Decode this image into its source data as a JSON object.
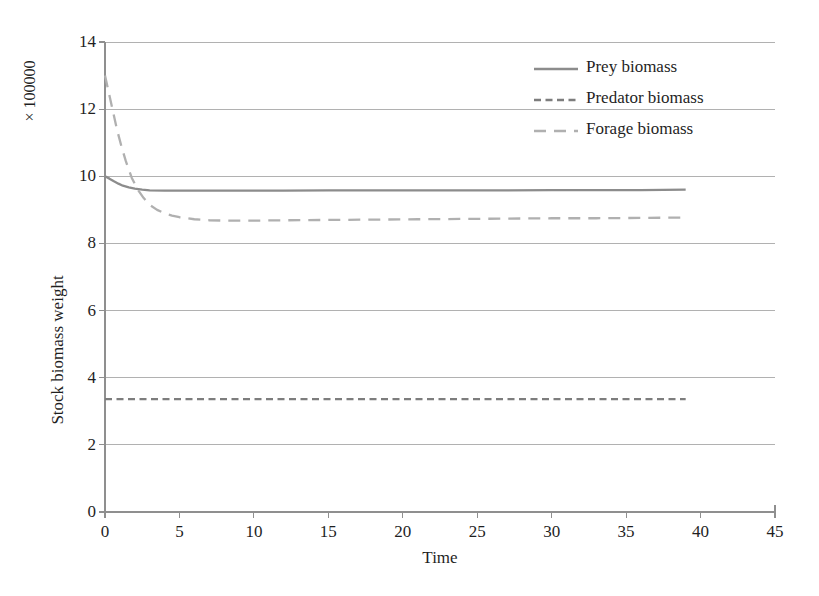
{
  "chart_data": {
    "type": "line",
    "title": "",
    "xlabel": "Time",
    "ylabel": "Stock biomass weight",
    "y_multiplier_label": "× 100000",
    "xlim": [
      0,
      45
    ],
    "ylim": [
      0,
      14
    ],
    "xticks": [
      0,
      5,
      10,
      15,
      20,
      25,
      30,
      35,
      40,
      45
    ],
    "yticks": [
      0,
      2,
      4,
      6,
      8,
      10,
      12,
      14
    ],
    "grid": "horizontal",
    "legend_position": "top-right",
    "series": [
      {
        "name": "Prey biomass",
        "style": "solid",
        "color": "#8c8c8c",
        "x": [
          0,
          0.3,
          0.6,
          0.9,
          1.2,
          1.6,
          2,
          2.5,
          3,
          4,
          5,
          6,
          8,
          10,
          12,
          15,
          18,
          21,
          24,
          27,
          30,
          33,
          36,
          39
        ],
        "y": [
          10.0,
          9.93,
          9.85,
          9.78,
          9.72,
          9.67,
          9.63,
          9.6,
          9.58,
          9.57,
          9.57,
          9.57,
          9.57,
          9.57,
          9.57,
          9.58,
          9.58,
          9.58,
          9.58,
          9.58,
          9.59,
          9.59,
          9.59,
          9.6
        ]
      },
      {
        "name": "Predator biomass",
        "style": "short-dash",
        "color": "#7d7d7d",
        "x": [
          0,
          5,
          10,
          15,
          20,
          25,
          30,
          35,
          39
        ],
        "y": [
          3.36,
          3.36,
          3.36,
          3.36,
          3.36,
          3.36,
          3.36,
          3.36,
          3.36
        ]
      },
      {
        "name": "Forage biomass",
        "style": "long-dash",
        "color": "#b0b0b0",
        "x": [
          0,
          0.2,
          0.5,
          0.8,
          1.1,
          1.4,
          1.8,
          2.2,
          2.6,
          3,
          3.5,
          4,
          4.5,
          5,
          6,
          7,
          8,
          10,
          12,
          15,
          18,
          21,
          24,
          27,
          30,
          33,
          36,
          39
        ],
        "y": [
          13.0,
          12.6,
          12.0,
          11.4,
          10.9,
          10.45,
          9.95,
          9.6,
          9.35,
          9.15,
          9.0,
          8.9,
          8.83,
          8.78,
          8.72,
          8.69,
          8.68,
          8.68,
          8.69,
          8.7,
          8.71,
          8.72,
          8.73,
          8.74,
          8.75,
          8.75,
          8.76,
          8.77
        ]
      }
    ]
  },
  "axes": {
    "x_tick_labels": [
      "0",
      "5",
      "10",
      "15",
      "20",
      "25",
      "30",
      "35",
      "40",
      "45"
    ],
    "y_tick_labels": [
      "0",
      "2",
      "4",
      "6",
      "8",
      "10",
      "12",
      "14"
    ],
    "x_title": "Time",
    "y_title": "Stock biomass weight",
    "y_multiplier": "× 100000"
  },
  "legend": {
    "items": [
      {
        "label": "Prey biomass",
        "style": "solid"
      },
      {
        "label": "Predator biomass",
        "style": "short-dash"
      },
      {
        "label": "Forage biomass",
        "style": "long-dash"
      }
    ]
  },
  "colors": {
    "grid": "#a9a9a9",
    "axis": "#8f8f8f",
    "text": "#1f1f1f",
    "prey": "#8c8c8c",
    "predator": "#7d7d7d",
    "forage": "#b0b0b0",
    "background": "#ffffff"
  }
}
